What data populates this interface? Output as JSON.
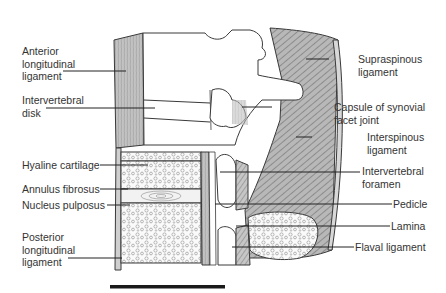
{
  "figure": {
    "type": "anatomical-diagram"
  },
  "labels_left": [
    {
      "id": "anterior-longitudinal-ligament",
      "text": "Anterior\nlongitudinal\nligament"
    },
    {
      "id": "intervertebral-disk",
      "text": "Intervertebral\ndisk"
    },
    {
      "id": "hyaline-cartilage",
      "text": "Hyaline cartilage"
    },
    {
      "id": "annulus-fibrosus",
      "text": "Annulus fibrosus"
    },
    {
      "id": "nucleus-pulposus",
      "text": "Nucleus pulposus"
    },
    {
      "id": "posterior-longitudinal-ligament",
      "text": "Posterior\nlongitudinal\nligament"
    }
  ],
  "labels_right": [
    {
      "id": "supraspinous-ligament",
      "text": "Supraspinous\nligament"
    },
    {
      "id": "capsule-synovial-facet-joint",
      "text": "Capsule of synovial\nfacet joint"
    },
    {
      "id": "interspinous-ligament",
      "text": "Interspinous\nligament"
    },
    {
      "id": "intervertebral-foramen",
      "text": "Intervertebral\nforamen"
    },
    {
      "id": "pedicle",
      "text": "Pedicle"
    },
    {
      "id": "lamina",
      "text": "Lamina"
    },
    {
      "id": "flaval-ligament",
      "text": "Flaval ligament"
    }
  ],
  "colors": {
    "ligament_gray": "#c4c4c4",
    "hatch": "#7a7a7a",
    "outline": "#3a3a3a",
    "bone": "#ffffff",
    "scale_bar": "#1a1a1a"
  }
}
